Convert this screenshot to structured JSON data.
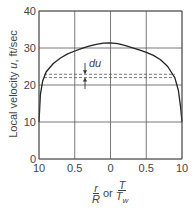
{
  "chart_data": {
    "type": "line",
    "title": "",
    "xlabel": "r/R or T/T_w",
    "ylabel": "Local velocity u, ft/sec",
    "x_tick_labels": [
      "10",
      "0.5",
      "0",
      "0.5",
      "10"
    ],
    "y_tick_labels": [
      "0",
      "10",
      "20",
      "30",
      "40"
    ],
    "ylim": [
      0,
      40
    ],
    "xlim": [
      -1.0,
      1.0
    ],
    "grid": true,
    "series": [
      {
        "name": "velocity profile",
        "x": [
          -1.0,
          -0.98,
          -0.95,
          -0.9,
          -0.8,
          -0.7,
          -0.6,
          -0.5,
          -0.4,
          -0.3,
          -0.2,
          -0.1,
          0.0,
          0.1,
          0.2,
          0.3,
          0.4,
          0.5,
          0.6,
          0.7,
          0.8,
          0.9,
          0.95,
          0.98,
          1.0
        ],
        "values": [
          10.0,
          17.5,
          21.0,
          23.5,
          25.8,
          27.3,
          28.4,
          29.2,
          29.9,
          30.5,
          31.0,
          31.3,
          31.4,
          31.2,
          30.7,
          30.1,
          29.5,
          28.8,
          28.0,
          26.8,
          25.0,
          22.0,
          18.5,
          14.0,
          10.0
        ]
      }
    ],
    "annotations": [
      {
        "text": "du",
        "type": "interval",
        "y_lower": 22.0,
        "y_upper": 22.9,
        "style": "dashed lines with arrows"
      }
    ]
  },
  "labels": {
    "ylabel_prefix": "Local velocity ",
    "ylabel_var": "u",
    "ylabel_suffix": ", ft/sec",
    "x_frac1_num": "r",
    "x_frac1_den": "R",
    "x_or": "or",
    "x_frac2_num": "T",
    "x_frac2_den": "T",
    "x_frac2_sub": "w",
    "du": "du"
  }
}
